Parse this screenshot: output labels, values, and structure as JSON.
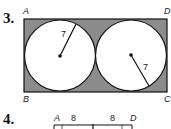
{
  "problems": [
    {
      "number": "3.",
      "vertices": {
        "A": "A",
        "B": "B",
        "C": "C",
        "D": "D"
      },
      "radius_labels": [
        "7",
        "7"
      ],
      "colors": {
        "shade": "#8c8c8c",
        "stroke": "#111111",
        "circle_fill": "#ffffff"
      }
    },
    {
      "number": "4.",
      "vertices": {
        "A": "A",
        "D": "D"
      },
      "segment_labels": [
        "8",
        "8"
      ]
    }
  ]
}
